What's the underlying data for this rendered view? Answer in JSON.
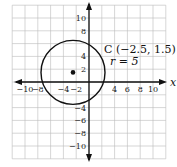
{
  "chart_data": {
    "type": "scatter",
    "title": "",
    "xlabel": "x",
    "ylabel": "y",
    "xlim": [
      -12,
      12
    ],
    "ylim": [
      -12,
      12
    ],
    "grid": true,
    "grid_step": 2,
    "x_ticks": [
      "-10",
      "-8",
      "-4",
      "-2",
      "4",
      "6",
      "8",
      "10"
    ],
    "y_ticks": [
      "10",
      "8",
      "4",
      "2",
      "-4",
      "-6",
      "-8",
      "-10"
    ],
    "circle": {
      "center": [
        -2.5,
        1.5
      ],
      "radius": 5
    },
    "points": [
      {
        "x": -2.5,
        "y": 1.5,
        "label": "C"
      }
    ],
    "annotations": [
      "C (−2.5, 1.5)",
      "r = 5"
    ]
  },
  "labels": {
    "x_axis": "x",
    "center": "C (−2.5, 1.5)",
    "radius": "r = 5"
  }
}
